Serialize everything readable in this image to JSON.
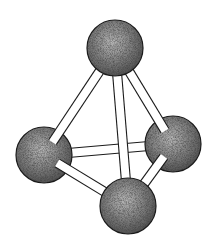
{
  "diagram": {
    "title": "Tetrahedral ball-and-stick molecular model",
    "type": "ball-and-stick",
    "geometry": "tetrahedral",
    "colors": {
      "background": "#ffffff",
      "atom_fill": "#8a8a8a",
      "atom_dark": "#3a3a3a",
      "atom_light": "#c4c4c4",
      "bond_fill": "#ffffff",
      "outline": "#1a1a1a"
    },
    "atom_radius": 28,
    "bond_width": 9,
    "atoms": [
      {
        "id": "top",
        "label": "top-atom",
        "cx": 115,
        "cy": 48
      },
      {
        "id": "left",
        "label": "left-atom",
        "cx": 44,
        "cy": 155
      },
      {
        "id": "right",
        "label": "right-atom",
        "cx": 173,
        "cy": 144
      },
      {
        "id": "bottom",
        "label": "bottom-front-atom",
        "cx": 128,
        "cy": 206
      }
    ],
    "bonds": [
      {
        "from": "left",
        "to": "right",
        "depth": "back"
      },
      {
        "from": "top",
        "to": "left",
        "depth": "mid"
      },
      {
        "from": "top",
        "to": "right",
        "depth": "mid"
      },
      {
        "from": "top",
        "to": "bottom",
        "depth": "front"
      },
      {
        "from": "left",
        "to": "bottom",
        "depth": "front"
      },
      {
        "from": "right",
        "to": "bottom",
        "depth": "front"
      }
    ]
  }
}
